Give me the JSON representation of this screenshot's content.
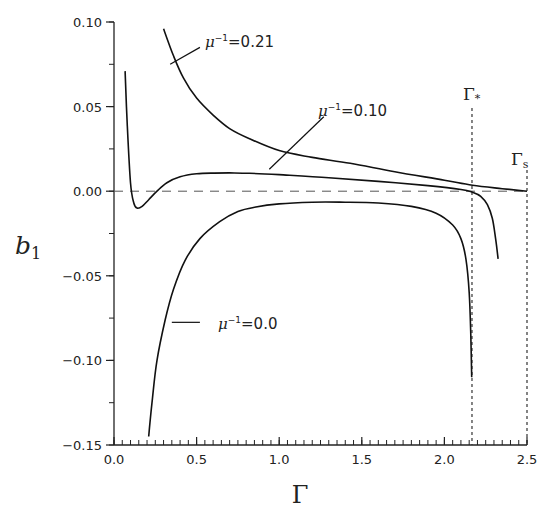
{
  "chart_data": {
    "type": "line",
    "title": "",
    "xlabel": "Γ",
    "ylabel": "b_1",
    "xlim": [
      0.0,
      2.5
    ],
    "ylim": [
      -0.15,
      0.1
    ],
    "grid": false,
    "legend": "none (inline curve labels)",
    "x_ticks": [
      0.0,
      0.5,
      1.0,
      1.5,
      2.0,
      2.5
    ],
    "x_tick_labels": [
      "0.0",
      "0.5",
      "1.0",
      "1.5",
      "2.0",
      "2.5"
    ],
    "x_minor_step": 0.05,
    "y_ticks": [
      0.1,
      0.05,
      0.0,
      -0.05,
      -0.1,
      -0.15
    ],
    "y_tick_labels": [
      "0.10",
      "0.05",
      "0.00",
      "−0.05",
      "−0.10",
      "−0.15"
    ],
    "y_minor_step": 0.025,
    "reference_lines": [
      {
        "orientation": "horizontal",
        "y": 0.0,
        "style": "dashed",
        "label": ""
      },
      {
        "orientation": "vertical",
        "x": 2.167,
        "style": "dotted",
        "label": "Γ*"
      },
      {
        "orientation": "vertical",
        "x": 2.5,
        "style": "dotted",
        "label": "Γs"
      }
    ],
    "series": [
      {
        "name": "μ⁻¹=0.21",
        "label_text": "μ⁻¹=0.21",
        "x": [
          0.3,
          0.36,
          0.42,
          0.5,
          0.6,
          0.7,
          0.82,
          1.0,
          1.2,
          1.43,
          1.7,
          2.0,
          2.17,
          2.35,
          2.5
        ],
        "y": [
          0.096,
          0.08,
          0.067,
          0.055,
          0.045,
          0.037,
          0.031,
          0.024,
          0.02,
          0.0165,
          0.0115,
          0.0065,
          0.0035,
          0.0015,
          0.0
        ]
      },
      {
        "name": "μ⁻¹=0.10",
        "label_text": "μ⁻¹=0.10",
        "x": [
          0.067,
          0.08,
          0.1,
          0.12,
          0.14,
          0.17,
          0.21,
          0.26,
          0.32,
          0.4,
          0.5,
          0.6,
          0.7,
          0.82,
          1.0,
          1.3,
          1.6,
          1.9,
          2.1,
          2.17,
          2.22,
          2.26,
          2.29,
          2.31,
          2.325
        ],
        "y": [
          0.071,
          0.04,
          0.005,
          -0.007,
          -0.01,
          -0.009,
          -0.005,
          0.0,
          0.005,
          0.0085,
          0.0103,
          0.0107,
          0.0108,
          0.0106,
          0.0098,
          0.008,
          0.0058,
          0.0033,
          0.001,
          -0.0006,
          -0.003,
          -0.008,
          -0.016,
          -0.028,
          -0.04
        ]
      },
      {
        "name": "μ⁻¹=0.0",
        "label_text": "μ⁻¹=0.0",
        "x": [
          0.21,
          0.23,
          0.26,
          0.31,
          0.36,
          0.43,
          0.52,
          0.64,
          0.75,
          0.85,
          1.0,
          1.2,
          1.4,
          1.6,
          1.8,
          1.95,
          2.05,
          2.1,
          2.13,
          2.15,
          2.16,
          2.165
        ],
        "y": [
          -0.145,
          -0.125,
          -0.1,
          -0.076,
          -0.058,
          -0.041,
          -0.028,
          -0.018,
          -0.012,
          -0.0095,
          -0.0075,
          -0.0065,
          -0.0065,
          -0.007,
          -0.009,
          -0.013,
          -0.02,
          -0.028,
          -0.04,
          -0.06,
          -0.085,
          -0.11
        ]
      }
    ],
    "annotations": [
      {
        "text": "μ⁻¹=0.21",
        "x": 0.55,
        "y": 0.087,
        "leader_from": [
          0.34,
          0.075
        ],
        "leader_to": [
          0.52,
          0.085
        ]
      },
      {
        "text": "μ⁻¹=0.10",
        "x": 1.3,
        "y": 0.047,
        "leader_from": [
          0.94,
          0.013
        ],
        "leader_to": [
          1.27,
          0.044
        ]
      },
      {
        "text": "μ⁻¹=0.0",
        "x": 0.55,
        "y": -0.0775,
        "leader_from": [
          0.35,
          -0.0775
        ],
        "leader_to": [
          0.52,
          -0.0775
        ]
      },
      {
        "text": "Γ*",
        "x": 2.14,
        "y": 0.064
      },
      {
        "text": "Γs",
        "x": 2.44,
        "y": 0.029
      }
    ]
  },
  "axes": {
    "x_title": "Γ",
    "y_title_main": "b",
    "y_title_sub": "1",
    "gamma_star_main": "Γ",
    "gamma_star_sub": "*",
    "gamma_s_main": "Γ",
    "gamma_s_sub": "s"
  },
  "labels": {
    "mu_021": {
      "main": "μ",
      "sup": "−1",
      "rest": "=0.21"
    },
    "mu_010": {
      "main": "μ",
      "sup": "−1",
      "rest": "=0.10"
    },
    "mu_000": {
      "main": "μ",
      "sup": "−1",
      "rest": "=0.0"
    }
  }
}
